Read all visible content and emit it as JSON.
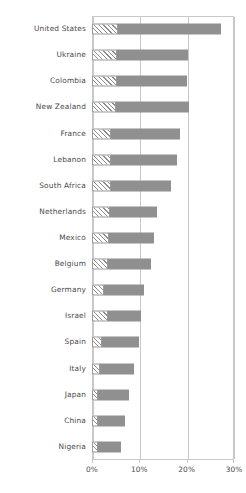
{
  "chart_data": {
    "type": "bar",
    "orientation": "horizontal",
    "title": "",
    "subtitle": "",
    "xlabel": "",
    "ylabel": "",
    "xlim": [
      0,
      30
    ],
    "xticks": [
      0,
      10,
      20,
      30
    ],
    "xtick_labels": [
      "0%",
      "10%",
      "20%",
      "30%"
    ],
    "grid": true,
    "legend": "none",
    "value_suffix": "%",
    "categories": [
      "United States",
      "Ukraine",
      "Colombia",
      "New Zealand",
      "France",
      "Lebanon",
      "South Africa",
      "Netherlands",
      "Mexico",
      "Belgium",
      "Germany",
      "Israel",
      "Spain",
      "Italy",
      "Japan",
      "China",
      "Nigeria"
    ],
    "values": [
      27.3,
      20.3,
      20.1,
      20.6,
      18.6,
      18.0,
      16.6,
      13.7,
      13.0,
      12.5,
      10.9,
      10.4,
      9.9,
      8.9,
      7.8,
      7.0,
      6.2
    ],
    "series": [
      {
        "name": "hatched-segment",
        "style": "diagonal-hatch",
        "values": [
          5.5,
          5.2,
          5.2,
          5.0,
          4.0,
          4.0,
          4.0,
          3.7,
          3.5,
          3.4,
          2.6,
          3.4,
          2.2,
          1.6,
          1.2,
          1.2,
          1.2
        ]
      },
      {
        "name": "solid-segment",
        "style": "solid-gray",
        "values": [
          21.8,
          15.1,
          14.9,
          15.6,
          14.6,
          14.0,
          12.6,
          10.0,
          9.5,
          9.1,
          8.3,
          7.0,
          7.7,
          7.3,
          6.6,
          5.8,
          5.0
        ]
      }
    ],
    "colors": {
      "solid": "#909090",
      "hatch_line": "#8d8d8d",
      "hatch_background": "#ffffff",
      "axis": "#c8c8c8",
      "text": "#4a4a4a",
      "background": "#ffffff"
    }
  }
}
